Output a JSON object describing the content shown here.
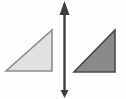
{
  "figure": {
    "width": 126,
    "height": 99,
    "background_color": "#fefefe"
  },
  "shapes": {
    "left_triangle": {
      "name": "light-gray-right-triangle",
      "fill_color": "#e1e1e1",
      "stroke_color": "#8d8d8d",
      "stroke_width": 1.6,
      "points": "6,71 52,71 52,30",
      "right_angle_corner": "bottom-right",
      "base_width": 46,
      "height": 41
    },
    "right_triangle": {
      "name": "dark-gray-right-triangle",
      "fill_color": "#8a8a8a",
      "stroke_color": "#4a4a4a",
      "stroke_width": 1.6,
      "points": "74,72 115,72 115,30",
      "right_angle_corner": "bottom-right",
      "base_width": 41,
      "height": 42
    }
  },
  "arrow": {
    "name": "vertical-double-headed-arrow",
    "color": "#3c3c3c",
    "shaft_x": 64.5,
    "shaft_top_y": 4,
    "shaft_bottom_y": 95,
    "shaft_width": 2.4,
    "top_head": {
      "label": "up-arrowhead",
      "points": "64.5,1 59.5,15 69.5,15",
      "size": "large"
    },
    "bottom_head": {
      "label": "down-arrowhead",
      "points": "64.5,98 60.5,90 68.5,90",
      "size": "small"
    }
  },
  "edge_shadow": {
    "color": "#d9d9d9"
  }
}
